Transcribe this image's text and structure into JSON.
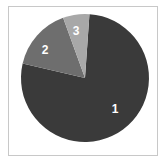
{
  "figure": {
    "background_color": "#ffffff",
    "frame_color": "#c8c8c8",
    "label_color": "#ffffff"
  },
  "chart_data": {
    "type": "pie",
    "title": "",
    "xlabel": "",
    "ylabel": "",
    "legend_position": "none",
    "grid": false,
    "labels_inside_slices": true,
    "center": {
      "x": 85,
      "y": 78
    },
    "radius": 64,
    "start_angle_deg": 4,
    "direction": "clockwise",
    "categories": [
      "1",
      "2",
      "3"
    ],
    "values": [
      78,
      16,
      6
    ],
    "percentages": [
      78,
      16,
      6
    ],
    "colors": [
      "#3a3a3a",
      "#6e6e6e",
      "#a8a8a8"
    ],
    "slices": [
      {
        "label": "1",
        "value": 78,
        "percent": 78,
        "color": "#3a3a3a",
        "start_deg": 4,
        "end_deg": 283,
        "label_x": 115,
        "label_y": 110
      },
      {
        "label": "2",
        "value": 16,
        "percent": 16,
        "color": "#6e6e6e",
        "start_deg": 283,
        "end_deg": 340,
        "label_x": 45,
        "label_y": 51
      },
      {
        "label": "3",
        "value": 6,
        "percent": 6,
        "color": "#a8a8a8",
        "start_deg": 340,
        "end_deg": 364,
        "label_x": 76,
        "label_y": 32
      }
    ]
  }
}
